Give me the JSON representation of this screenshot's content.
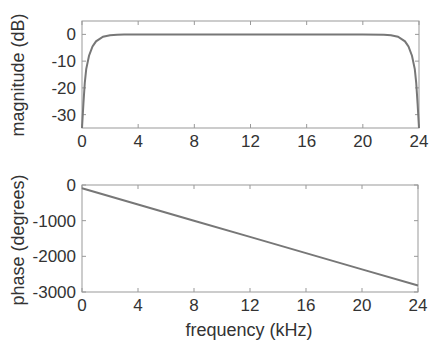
{
  "chart_data": [
    {
      "type": "line",
      "title": "",
      "xlabel": "",
      "ylabel": "magnitude (dB)",
      "xlim": [
        0,
        24
      ],
      "ylim": [
        -35,
        5
      ],
      "xticks": [
        0,
        4,
        8,
        12,
        16,
        20,
        24
      ],
      "yticks": [
        0,
        -10,
        -20,
        -30
      ],
      "xtick_labels": [
        "0",
        "4",
        "8",
        "12",
        "16",
        "20",
        "24"
      ],
      "ytick_labels": [
        "0",
        "-10",
        "-20",
        "-30"
      ],
      "grid": false,
      "series": [
        {
          "name": "magnitude",
          "x": [
            0.0,
            0.1,
            0.2,
            0.3,
            0.5,
            0.75,
            1.0,
            1.5,
            2.0,
            2.5,
            3.0,
            4,
            8,
            12,
            16,
            20,
            21.5,
            22.0,
            22.5,
            23.0,
            23.25,
            23.5,
            23.7,
            23.8,
            23.9,
            24.0
          ],
          "values": [
            -35,
            -26,
            -18,
            -13,
            -8,
            -4.5,
            -2.6,
            -0.9,
            -0.3,
            -0.1,
            0,
            0,
            0,
            0,
            0,
            0,
            -0.1,
            -0.3,
            -0.9,
            -2.6,
            -4.5,
            -8,
            -13,
            -18,
            -26,
            -35
          ]
        }
      ]
    },
    {
      "type": "line",
      "title": "",
      "xlabel": "frequency (kHz)",
      "ylabel": "phase (degrees)",
      "xlim": [
        0,
        24
      ],
      "ylim": [
        -3000,
        0
      ],
      "xticks": [
        0,
        4,
        8,
        12,
        16,
        20,
        24
      ],
      "yticks": [
        0,
        -1000,
        -2000,
        -3000
      ],
      "xtick_labels": [
        "0",
        "4",
        "8",
        "12",
        "16",
        "20",
        "24"
      ],
      "ytick_labels": [
        "0",
        "-1000",
        "-2000",
        "-3000"
      ],
      "grid": false,
      "series": [
        {
          "name": "phase",
          "x": [
            0,
            4,
            8,
            12,
            16,
            20,
            24
          ],
          "values": [
            -90,
            -545,
            -1000,
            -1455,
            -1910,
            -2365,
            -2820
          ]
        }
      ]
    }
  ]
}
